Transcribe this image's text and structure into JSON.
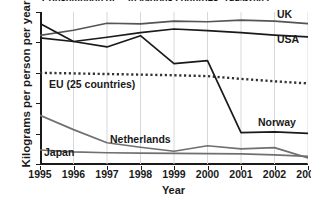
{
  "chart_data": {
    "type": "line",
    "title": "Consumption of ... in various countries, 1995-2003",
    "xlabel": "Year",
    "ylabel": "Kilograms per person per year",
    "x": [
      1995,
      1996,
      1997,
      1998,
      1999,
      2000,
      2001,
      2002,
      2003
    ],
    "xticklabels": [
      "1995",
      "1996",
      "1997",
      "1998",
      "1999",
      "2000",
      "2001",
      "2002",
      "2003"
    ],
    "yticklabels": [
      "0",
      "100",
      "200",
      "300",
      "400",
      "500"
    ],
    "yticks": [
      0,
      100,
      200,
      300,
      400,
      500
    ],
    "ylim": [
      0,
      500
    ],
    "xlim": [
      1995,
      2003
    ],
    "grid": "vertical",
    "legend": "inline-labels",
    "series": [
      {
        "name": "UK",
        "values": [
          423,
          440,
          463,
          461,
          470,
          468,
          473,
          470,
          462
        ],
        "color": "#555555",
        "style": "solid",
        "label_x": 277,
        "label_y": 8
      },
      {
        "name": "USA",
        "values": [
          415,
          403,
          417,
          432,
          444,
          439,
          432,
          424,
          418
        ],
        "color": "#1a1a1a",
        "style": "solid",
        "label_x": 277,
        "label_y": 33
      },
      {
        "name": "EU (25 countries)",
        "values": [
          300,
          298,
          296,
          294,
          292,
          289,
          280,
          272,
          265
        ],
        "color": "#333333",
        "style": "dotted",
        "label_x": 49,
        "label_y": 78
      },
      {
        "name": "Norway",
        "values": [
          462,
          403,
          385,
          422,
          330,
          340,
          103,
          106,
          101
        ],
        "color": "#1a1a1a",
        "style": "solid",
        "label_x": 258,
        "label_y": 116
      },
      {
        "name": "Netherlands",
        "values": [
          160,
          113,
          70,
          55,
          42,
          60,
          50,
          54,
          20
        ],
        "color": "#707070",
        "style": "solid",
        "label_x": 110,
        "label_y": 133
      },
      {
        "name": "Japan",
        "values": [
          46,
          40,
          37,
          36,
          35,
          34,
          33,
          30,
          25
        ],
        "color": "#707070",
        "style": "solid",
        "label_x": 44,
        "label_y": 146
      }
    ]
  }
}
